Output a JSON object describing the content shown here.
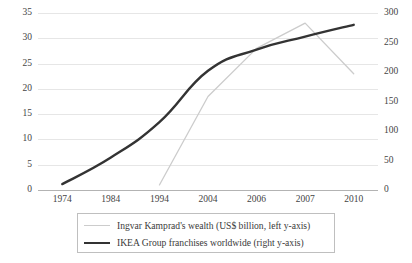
{
  "chart_data": {
    "type": "line",
    "title": "",
    "subtitle": "",
    "xlabel": "",
    "ylabel": "",
    "grid": "horizontal",
    "legend_position": "bottom",
    "categories": [
      "1974",
      "1984",
      "1994",
      "2004",
      "2006",
      "2007",
      "2010"
    ],
    "axes": {
      "left": {
        "label": "Ingvar Kamprad's wealth (US$ billion)",
        "min": 0,
        "max": 35,
        "step": 5,
        "ticks": [
          "0",
          "5",
          "10",
          "15",
          "20",
          "25",
          "30",
          "35"
        ],
        "tick_values": [
          0,
          5,
          10,
          15,
          20,
          25,
          30,
          35
        ]
      },
      "right": {
        "label": "IKEA Group franchises worldwide",
        "min": 0,
        "max": 300,
        "step": 50,
        "ticks": [
          "0",
          "50",
          "100",
          "150",
          "200",
          "250",
          "300"
        ],
        "tick_values": [
          0,
          50,
          100,
          150,
          200,
          250,
          300
        ]
      }
    },
    "series": [
      {
        "name": "Ingvar Kamprad's wealth (US$ billion, left y-axis)",
        "axis": "left",
        "color": "#cccccc",
        "width": 1.3,
        "values": [
          null,
          null,
          1.0,
          18.5,
          28.0,
          33.0,
          23.0
        ]
      },
      {
        "name": "IKEA Group franchises worldwide (right y-axis)",
        "axis": "right",
        "color": "#333333",
        "width": 2.4,
        "values": [
          10,
          55,
          115,
          202,
          238,
          260,
          280
        ]
      }
    ]
  },
  "legend": {
    "entries": [
      {
        "label": "Ingvar Kamprad's wealth (US$ billion, left y-axis)",
        "swatch": "thin-grey-line"
      },
      {
        "label": "IKEA Group franchises worldwide (right y-axis)",
        "swatch": "thick-dark-line"
      }
    ]
  },
  "colors": {
    "wealth_line": "#cccccc",
    "franchise_line": "#333333",
    "gridline": "#e6e6e6",
    "baseline": "#b3b3b3",
    "text": "#3f3f3f",
    "legend_border": "#bfbfbf"
  }
}
